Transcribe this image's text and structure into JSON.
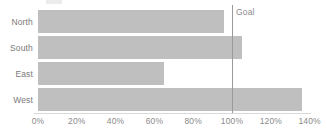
{
  "chart_data": {
    "type": "bar",
    "orientation": "horizontal",
    "title": "",
    "xlabel": "",
    "ylabel": "",
    "categories": [
      "North",
      "South",
      "East",
      "West"
    ],
    "values": [
      96,
      105,
      65,
      136
    ],
    "value_unit": "%",
    "xlim": [
      0,
      140
    ],
    "xticks": [
      0,
      20,
      40,
      60,
      80,
      100,
      120,
      140
    ],
    "xtick_labels": [
      "0%",
      "20%",
      "40%",
      "60%",
      "80%",
      "100%",
      "120%",
      "140%"
    ],
    "grid": false,
    "legend": null,
    "series": [
      {
        "name": "Actual",
        "values": [
          96,
          105,
          65,
          136
        ]
      }
    ],
    "annotations": [
      {
        "type": "reference-line",
        "label": "Goal",
        "value": 100,
        "axis": "x"
      }
    ],
    "colors": {
      "bar": "#bfbfbf",
      "goal_line": "#9a9a9a",
      "axis": "#d9d9d9",
      "text": "#7a7a7a",
      "background": "#ffffff"
    }
  },
  "labels": {
    "goal": "Goal"
  }
}
